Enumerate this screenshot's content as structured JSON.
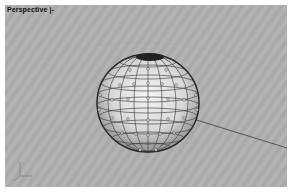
{
  "viewport": {
    "label": "Perspective |-",
    "background": "#b3b3b3"
  },
  "scene": {
    "objects": [
      {
        "type": "sphere",
        "selected": true,
        "control_points_visible": true,
        "center_px": [
          148,
          103
        ],
        "radius_px": [
          51,
          49
        ]
      },
      {
        "type": "line",
        "from_px": [
          190,
          118
        ],
        "to_px": [
          287,
          148
        ]
      }
    ],
    "axis_icon": "xyz-axis-icon"
  }
}
